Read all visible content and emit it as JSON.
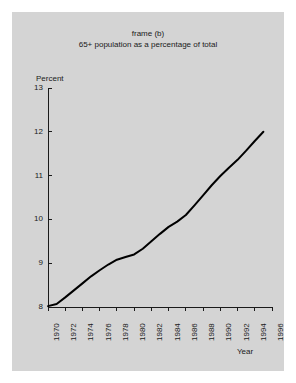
{
  "chart_data": {
    "type": "line",
    "title": "frame (b)",
    "subtitle": "65+ population as a percentage of total",
    "xlabel": "Year",
    "ylabel": "Percent",
    "xlim": [
      1970,
      1996
    ],
    "ylim": [
      8,
      13
    ],
    "grid": false,
    "legend": null,
    "ytick_labels": [
      "13",
      "12",
      "11",
      "10",
      "9",
      "8"
    ],
    "yticks": [
      13,
      12,
      11,
      10,
      9,
      8
    ],
    "xtick_labels": [
      "1970",
      "1972",
      "1974",
      "1976",
      "1978",
      "1980",
      "1982",
      "1984",
      "1986",
      "1988",
      "1990",
      "1992",
      "1994",
      "1996"
    ],
    "xticks": [
      1970,
      1972,
      1974,
      1976,
      1978,
      1980,
      1982,
      1984,
      1986,
      1988,
      1990,
      1992,
      1994,
      1996
    ],
    "series": [
      {
        "name": "65+ population as a percentage of total",
        "color": "#000000",
        "x": [
          1970,
          1971,
          1972,
          1973,
          1974,
          1975,
          1976,
          1977,
          1978,
          1979,
          1980,
          1981,
          1982,
          1983,
          1984,
          1985,
          1986,
          1987,
          1988,
          1989,
          1990,
          1991,
          1992,
          1993,
          1994,
          1995
        ],
        "values": [
          8.02,
          8.07,
          8.22,
          8.38,
          8.54,
          8.7,
          8.84,
          8.97,
          9.08,
          9.14,
          9.2,
          9.33,
          9.5,
          9.67,
          9.83,
          9.95,
          10.1,
          10.32,
          10.55,
          10.78,
          10.99,
          11.18,
          11.36,
          11.57,
          11.79,
          12.0
        ]
      }
    ]
  },
  "figure": {
    "background_color": "#d4d4d4",
    "page_color": "#ffffff",
    "axis_color": "#1a1a1a"
  }
}
